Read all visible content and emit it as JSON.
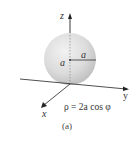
{
  "figure": {
    "caption": "(a)",
    "equation": "ρ = 2a cos φ",
    "axes": {
      "x_label": "x",
      "y_label": "y",
      "z_label": "z"
    },
    "sphere": {
      "radius_label": "a",
      "center_label": "a"
    },
    "colors": {
      "sphere_fill": "#d9d9d9",
      "axis": "#333333",
      "dotted": "#888888"
    }
  }
}
